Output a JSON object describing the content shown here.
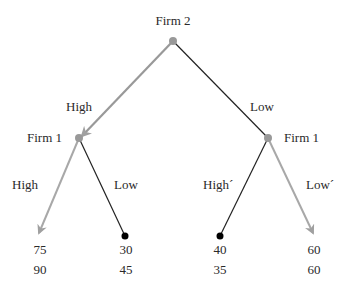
{
  "diagram": {
    "type": "game-tree",
    "colors": {
      "equilibrium_path": "#a0a0a0",
      "other_path": "#222222",
      "node": "#999999",
      "terminal_dot": "#000000"
    },
    "root": {
      "player": "Firm 2"
    },
    "nodes": [
      {
        "id": "left",
        "player": "Firm 1"
      },
      {
        "id": "right",
        "player": "Firm 1"
      }
    ],
    "edges": [
      {
        "from": "root",
        "to": "left",
        "label": "High",
        "highlighted": true
      },
      {
        "from": "root",
        "to": "right",
        "label": "Low",
        "highlighted": false
      },
      {
        "from": "left",
        "to": "leaf1",
        "label": "High",
        "highlighted": true
      },
      {
        "from": "left",
        "to": "leaf2",
        "label": "Low",
        "highlighted": false
      },
      {
        "from": "right",
        "to": "leaf3",
        "label": "High´",
        "highlighted": false
      },
      {
        "from": "right",
        "to": "leaf4",
        "label": "Low´",
        "highlighted": true
      }
    ],
    "payoffs": [
      {
        "top": "75",
        "bottom": "90"
      },
      {
        "top": "30",
        "bottom": "45"
      },
      {
        "top": "40",
        "bottom": "35"
      },
      {
        "top": "60",
        "bottom": "60"
      }
    ]
  }
}
